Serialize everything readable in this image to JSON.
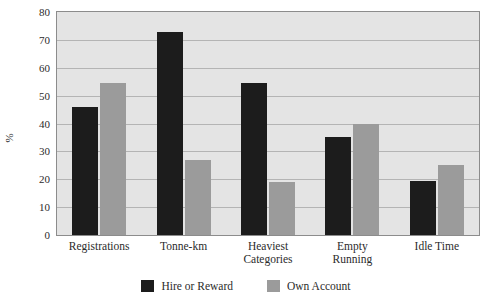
{
  "chart_data": {
    "type": "bar",
    "title": "",
    "xlabel": "",
    "ylabel": "%",
    "ylim": [
      0,
      80
    ],
    "yticks": [
      0,
      10,
      20,
      30,
      40,
      50,
      60,
      70,
      80
    ],
    "ytick_labels": [
      "0",
      "10",
      "20",
      "30",
      "40",
      "50",
      "60",
      "70",
      "80"
    ],
    "grid": true,
    "legend_position": "bottom-center",
    "categories": [
      "Registrations",
      "Tonne-km",
      "Heaviest\nCategories",
      "Empty\nRunning",
      "Idle Time"
    ],
    "series": [
      {
        "name": "Hire or Reward",
        "color": "#1c1c1c",
        "values": [
          46,
          73,
          54.5,
          35,
          19.5
        ]
      },
      {
        "name": "Own Account",
        "color": "#9b9b9b",
        "values": [
          54.5,
          27,
          19,
          40,
          25
        ]
      }
    ],
    "plot_background": "#e4e4e4",
    "grid_color": "#b4b4b4",
    "axis_color": "#8c8c8c"
  }
}
